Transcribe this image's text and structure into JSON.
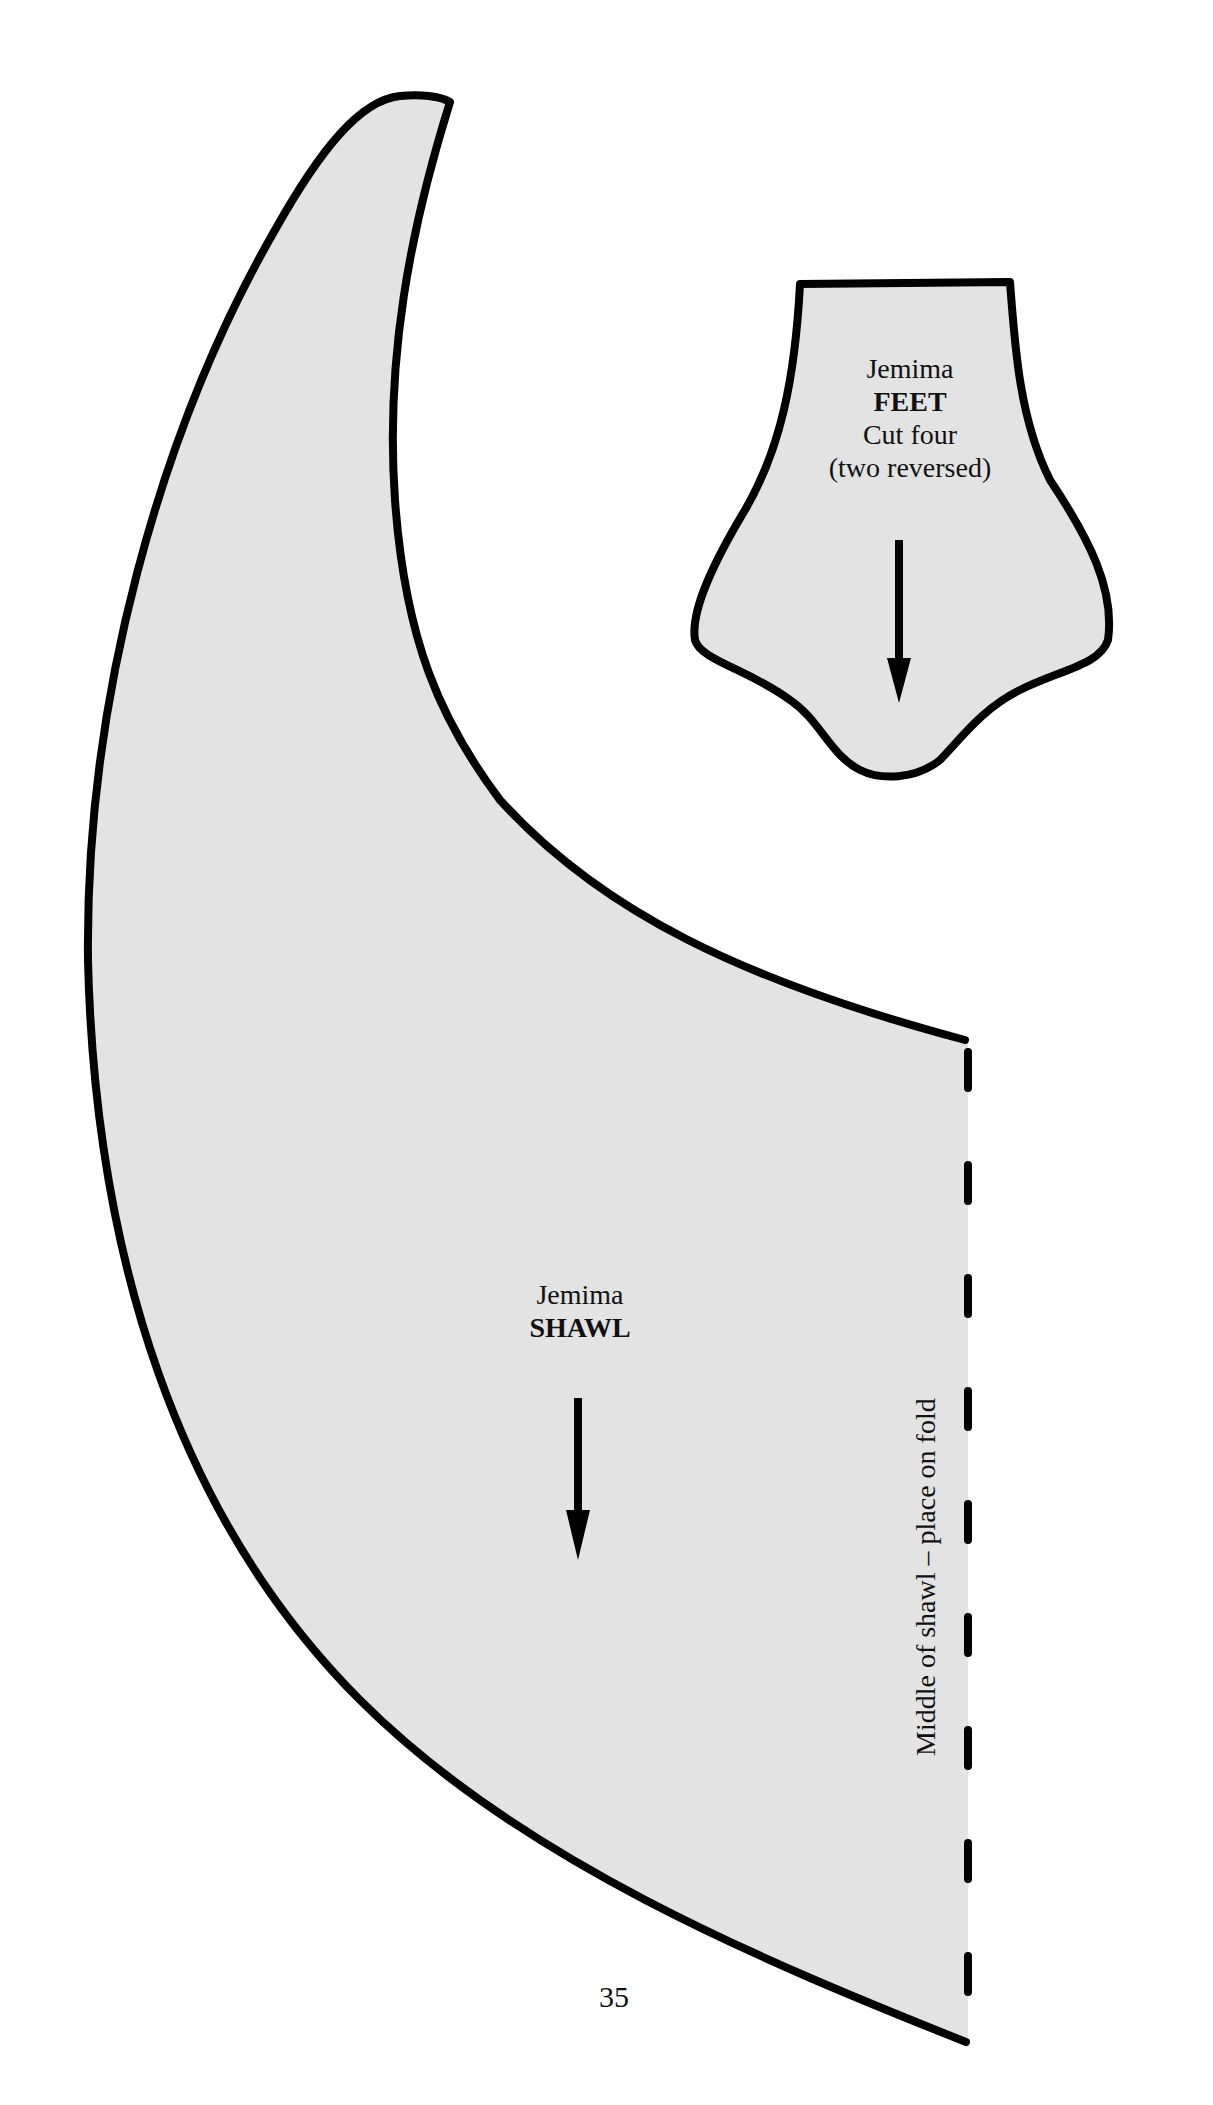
{
  "colors": {
    "background": "#ffffff",
    "piece_fill": "#e3e3e3",
    "outline": "#000000",
    "text": "#111111"
  },
  "pieces": {
    "feet": {
      "name_line": "Jemima",
      "piece_line": "FEET",
      "cut_line": "Cut four",
      "note_line": "(two reversed)",
      "grainline_icon": "arrow-down"
    },
    "shawl": {
      "name_line": "Jemima",
      "piece_line": "SHAWL",
      "grainline_icon": "arrow-down",
      "fold_label": "Middle of shawl – place on fold",
      "fold_line_style": "dashed"
    }
  },
  "page_number": "35"
}
